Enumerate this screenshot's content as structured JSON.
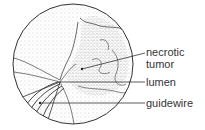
{
  "diagram": {
    "labels": {
      "necrotic_tumor_line1": "necrotic",
      "necrotic_tumor_line2": "tumor",
      "lumen": "lumen",
      "guidewire": "guidewire"
    },
    "colors": {
      "ink": "#333333",
      "stipple": "#9a9a9a",
      "background": "#ffffff"
    }
  }
}
